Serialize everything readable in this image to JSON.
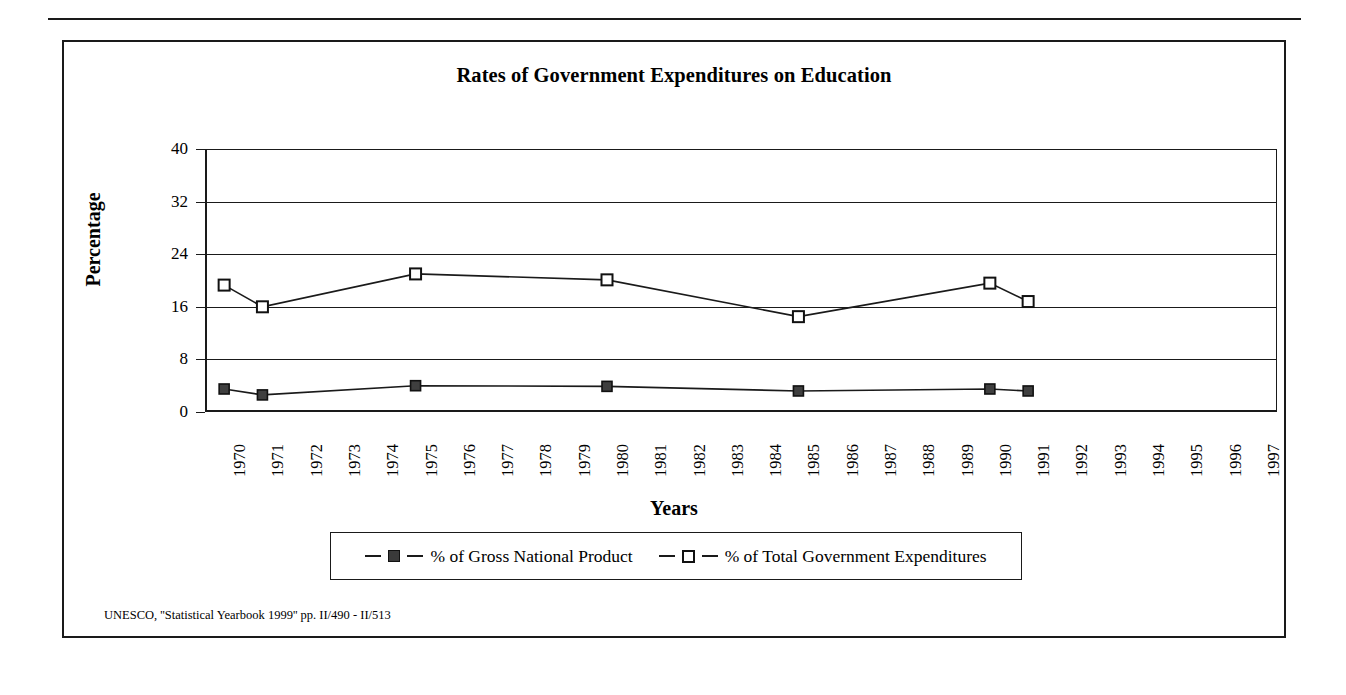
{
  "chart_data": {
    "type": "line",
    "title": "Rates of Government Expenditures on Education",
    "xlabel": "Years",
    "ylabel": "Percentage",
    "ylim": [
      0,
      40
    ],
    "yticks": [
      0,
      8,
      16,
      24,
      32,
      40
    ],
    "grid": true,
    "legend_position": "bottom",
    "categories": [
      "1970",
      "1971",
      "1972",
      "1973",
      "1974",
      "1975",
      "1976",
      "1977",
      "1978",
      "1979",
      "1980",
      "1981",
      "1982",
      "1983",
      "1984",
      "1985",
      "1986",
      "1987",
      "1988",
      "1989",
      "1990",
      "1991",
      "1992",
      "1993",
      "1994",
      "1995",
      "1996",
      "1997"
    ],
    "series": [
      {
        "name": "% of Gross National Product",
        "marker": "filled-square",
        "x": [
          "1970",
          "1971",
          "1975",
          "1980",
          "1985",
          "1990",
          "1991"
        ],
        "values": [
          3.5,
          2.6,
          4.0,
          3.9,
          3.2,
          3.5,
          3.2
        ]
      },
      {
        "name": "% of Total Government Expenditures",
        "marker": "hollow-square",
        "x": [
          "1970",
          "1971",
          "1975",
          "1980",
          "1985",
          "1990",
          "1991"
        ],
        "values": [
          19.3,
          16.0,
          21.0,
          20.1,
          14.5,
          19.6,
          16.8
        ]
      }
    ],
    "source_note": "UNESCO, ''Statistical Yearbook 1999'' pp. II/490 - II/513",
    "colors": {
      "ink": "#1a1a1a",
      "marker_fill": "#3f3f3f",
      "background": "#ffffff"
    }
  }
}
